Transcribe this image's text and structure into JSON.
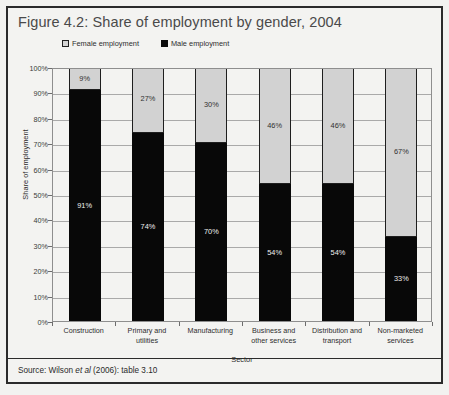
{
  "figure": {
    "title": "Figure 4.2: Share of employment by gender, 2004",
    "source_prefix": "Source: Wilson ",
    "source_italic": "et al",
    "source_suffix": " (2006): table 3.10"
  },
  "legend": {
    "position": "top",
    "items": [
      {
        "label": "Female employment",
        "color": "#d2d2d2",
        "swatch": "female-swatch-icon"
      },
      {
        "label": "Male employment",
        "color": "#080808",
        "swatch": "male-swatch-icon"
      }
    ]
  },
  "axes": {
    "y_title": "Share of employment",
    "x_title": "Sector",
    "y_ticks": [
      "0%",
      "10%",
      "20%",
      "30%",
      "40%",
      "50%",
      "60%",
      "70%",
      "80%",
      "90%",
      "100%"
    ]
  },
  "chart_data": {
    "type": "bar",
    "title": "Figure 4.2: Share of employment by gender, 2004",
    "subtitle": "",
    "xlabel": "Sector",
    "ylabel": "Share of employment",
    "ylim": [
      0,
      100
    ],
    "stacked": true,
    "grid": true,
    "legend_position": "top",
    "categories": [
      "Construction",
      "Primary and utilities",
      "Manufacturing",
      "Business and other services",
      "Distribution and transport",
      "Non-marketed services"
    ],
    "category_lines": [
      [
        "Construction"
      ],
      [
        "Primary and",
        "utilities"
      ],
      [
        "Manufacturing"
      ],
      [
        "Business and",
        "other services"
      ],
      [
        "Distribution and",
        "transport"
      ],
      [
        "Non-marketed",
        "services"
      ]
    ],
    "series": [
      {
        "name": "Female employment",
        "color": "#d2d2d2",
        "values": [
          9,
          27,
          30,
          46,
          46,
          67
        ],
        "labels": [
          "9%",
          "27%",
          "30%",
          "46%",
          "46%",
          "67%"
        ]
      },
      {
        "name": "Male employment",
        "color": "#080808",
        "values": [
          91,
          74,
          70,
          54,
          54,
          33
        ],
        "labels": [
          "91%",
          "74%",
          "70%",
          "54%",
          "54%",
          "33%"
        ]
      }
    ],
    "ytick_values": [
      0,
      10,
      20,
      30,
      40,
      50,
      60,
      70,
      80,
      90,
      100
    ],
    "ytick_labels": [
      "0%",
      "10%",
      "20%",
      "30%",
      "40%",
      "50%",
      "60%",
      "70%",
      "80%",
      "90%",
      "100%"
    ]
  }
}
